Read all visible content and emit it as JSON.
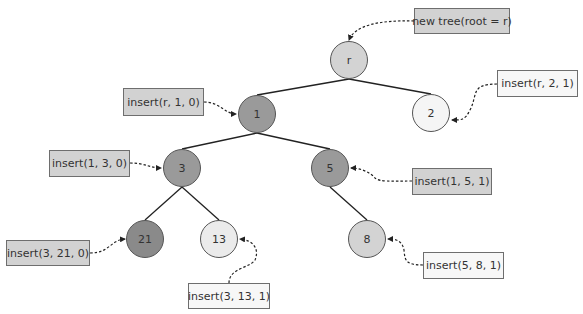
{
  "diagram": {
    "type": "tree",
    "nodes": [
      {
        "id": "r",
        "label": "r",
        "x": 349,
        "y": 60,
        "fill": "#d3d3d3"
      },
      {
        "id": "1",
        "label": "1",
        "x": 257,
        "y": 114,
        "fill": "#9a9a9a"
      },
      {
        "id": "2",
        "label": "2",
        "x": 431,
        "y": 113,
        "fill": "#f5f5f5"
      },
      {
        "id": "3",
        "label": "3",
        "x": 182,
        "y": 168,
        "fill": "#9a9a9a"
      },
      {
        "id": "5",
        "label": "5",
        "x": 330,
        "y": 168,
        "fill": "#9a9a9a"
      },
      {
        "id": "21",
        "label": "21",
        "x": 145,
        "y": 239,
        "fill": "#8a8a8a"
      },
      {
        "id": "13",
        "label": "13",
        "x": 219,
        "y": 239,
        "fill": "#ebebeb"
      },
      {
        "id": "8",
        "label": "8",
        "x": 367,
        "y": 239,
        "fill": "#d3d3d3"
      }
    ],
    "edges": [
      {
        "from": "r",
        "to": "1"
      },
      {
        "from": "r",
        "to": "2"
      },
      {
        "from": "1",
        "to": "3"
      },
      {
        "from": "1",
        "to": "5"
      },
      {
        "from": "3",
        "to": "21"
      },
      {
        "from": "3",
        "to": "13"
      },
      {
        "from": "5",
        "to": "8"
      }
    ],
    "annotations": [
      {
        "text": "new tree(root = r)",
        "x": 414,
        "y": 8,
        "w": 96,
        "h": 26,
        "style": "dark",
        "target": "r"
      },
      {
        "text": "insert(r, 2, 1)",
        "x": 497,
        "y": 70,
        "w": 81,
        "h": 27,
        "style": "light",
        "target": "2"
      },
      {
        "text": "insert(r, 1, 0)",
        "x": 123,
        "y": 88,
        "w": 81,
        "h": 28,
        "style": "dark",
        "target": "1"
      },
      {
        "text": "insert(1, 3, 0)",
        "x": 49,
        "y": 150,
        "w": 81,
        "h": 27,
        "style": "dark",
        "target": "3"
      },
      {
        "text": "insert(1, 5, 1)",
        "x": 412,
        "y": 168,
        "w": 80,
        "h": 27,
        "style": "dark",
        "target": "5"
      },
      {
        "text": "insert(3, 21, 0)",
        "x": 6,
        "y": 240,
        "w": 84,
        "h": 26,
        "style": "dark",
        "target": "21"
      },
      {
        "text": "insert(3, 13, 1)",
        "x": 188,
        "y": 283,
        "w": 82,
        "h": 26,
        "style": "light",
        "target": "13"
      },
      {
        "text": "insert(5, 8, 1)",
        "x": 423,
        "y": 252,
        "w": 81,
        "h": 27,
        "style": "light",
        "target": "8"
      }
    ],
    "connectors": [
      {
        "d": "M414,21 C380,20 355,25 349,40",
        "end": [
          349,
          41
        ]
      },
      {
        "d": "M497,84 C470,84 478,95 470,110 C465,120 462,120 452,120",
        "end": [
          452,
          120
        ]
      },
      {
        "d": "M204,102 C220,102 225,114 236,114",
        "end": [
          237,
          114
        ]
      },
      {
        "d": "M130,163 C145,163 150,168 161,168",
        "end": [
          162,
          168
        ]
      },
      {
        "d": "M412,181 C390,181 380,182 375,178 C370,172 360,168 351,168",
        "end": [
          350,
          168
        ]
      },
      {
        "d": "M90,253 C110,253 110,240 125,239",
        "end": [
          125,
          239
        ]
      },
      {
        "d": "M229,283 C229,268 250,268 255,260 C260,248 252,240 240,239",
        "end": [
          239,
          239
        ]
      },
      {
        "d": "M423,265 C405,265 405,260 404,250 C402,240 395,239 388,239",
        "end": [
          388,
          239
        ]
      }
    ],
    "node_radius": 19
  }
}
